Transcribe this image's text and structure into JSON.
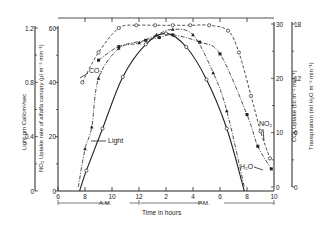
{
  "chart_data": {
    "type": "line",
    "title": "",
    "xlabel": "Time in hours",
    "x_ticks": [
      "6",
      "8",
      "10",
      "12",
      "2",
      "4",
      "6",
      "8",
      "10"
    ],
    "x_period_labels": [
      "A.M.",
      "P.M."
    ],
    "x_hours_24": [
      6,
      8,
      10,
      12,
      14,
      16,
      18,
      20,
      22
    ],
    "axes": {
      "light": {
        "label": "Light gm Cal/cm²/sec",
        "ticks": [
          "0",
          "0.4",
          "0.8",
          "1.2"
        ],
        "range": [
          0,
          1.2
        ],
        "side": "left-outer"
      },
      "no2": {
        "label": "NO₂ Uptake rate of alfalfa canopy (µl m⁻² min⁻¹)",
        "ticks": [
          "0",
          "20",
          "40",
          "60"
        ],
        "range": [
          0,
          60
        ],
        "side": "left-inner"
      },
      "co2": {
        "label": "CO₂ Uptake (cc m⁻² min⁻¹)",
        "ticks": [
          "0",
          "10",
          "20",
          "30"
        ],
        "range": [
          0,
          30
        ],
        "side": "right-inner"
      },
      "transpiration": {
        "label": "Transpiration (ml H₂O m⁻² min⁻¹)",
        "ticks": [
          "0",
          "6",
          "12",
          "18"
        ],
        "range": [
          0,
          18
        ],
        "side": "right-outer"
      }
    },
    "series": [
      {
        "name": "Light",
        "axis": "light",
        "marker": "open-circle",
        "line": "solid",
        "x": [
          7.6,
          8.1,
          9.3,
          10.8,
          12.5,
          14.0,
          15.5,
          17.0,
          18.5,
          19.8
        ],
        "values": [
          0.0,
          0.15,
          0.46,
          0.84,
          1.08,
          1.16,
          1.06,
          0.82,
          0.46,
          0.0
        ]
      },
      {
        "name": "NO2",
        "axis": "no2",
        "marker": "open-circle",
        "line": "dashed",
        "x": [
          7.8,
          9.0,
          10.5,
          11.8,
          13.2,
          14.5,
          15.8,
          17.2,
          18.6,
          19.4,
          20.3,
          21.0,
          21.7
        ],
        "values": [
          40,
          51,
          60,
          61,
          61,
          61,
          61,
          61,
          59,
          51,
          35,
          22,
          12
        ]
      },
      {
        "name": "CO2",
        "axis": "co2",
        "marker": "triangle",
        "line": "dash-dot",
        "x": [
          7.5,
          8.0,
          8.5,
          9.0,
          10.5,
          12.0,
          13.3,
          14.5,
          16.0,
          17.5,
          18.5,
          19.8
        ],
        "values": [
          0,
          7,
          11,
          20,
          25.5,
          26.5,
          28,
          29,
          28,
          21,
          14,
          0
        ]
      },
      {
        "name": "H2O",
        "axis": "transpiration",
        "marker": "filled-square",
        "line": "dash-dot",
        "x": [
          9.0,
          10.5,
          12.5,
          13.5,
          14.5,
          16.5,
          18.0,
          20.0,
          20.8,
          21.8
        ],
        "values": [
          14.0,
          15.5,
          16.2,
          16.5,
          16.8,
          16.0,
          14.7,
          8.0,
          4.5,
          2.0
        ]
      }
    ],
    "annotations": [
      "CO₂",
      "Light",
      "NO₂",
      "H₂O"
    ],
    "grid": false,
    "legend": "inline labels"
  },
  "labels": {
    "xlabel": "Time in hours",
    "am": "A.M.",
    "pm": "P.M.",
    "light_axis": "Light gm Cal/cm²/sec",
    "no2_axis": "NO₂ Uptake rate of alfalfa canopy (µl m⁻² min⁻¹)",
    "co2_axis": "CO₂ Uptake (cc m⁻² min⁻¹)",
    "transp_axis": "Transpiration (ml H₂O m⁻² min⁻¹)",
    "co2_tag": "CO₂",
    "light_tag": "Light",
    "no2_tag": "NO₂",
    "h2o_tag": "H₂O"
  }
}
